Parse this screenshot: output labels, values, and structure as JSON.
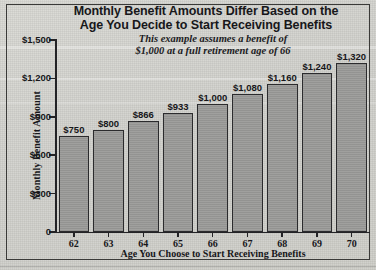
{
  "figure": {
    "title_line1": "Monthly Benefit Amounts Differ Based on the",
    "title_line2": "Age You Decide to Start Receiving Benefits",
    "subtitle_line1": "This example assumes a benefit of",
    "subtitle_line2": "$1,000 at a full retirement age of 66",
    "bar_fill_color": "#9b9b99",
    "bar_outline_color": "#2b2b2d",
    "background_color": "#d4d4cf",
    "text_color": "#17171a"
  },
  "chart_data": {
    "type": "bar",
    "title": "Monthly Benefit Amounts Differ Based on the Age You Decide to Start Receiving Benefits",
    "subtitle": "This example assumes a benefit of $1,000 at a full retirement age of 66",
    "xlabel": "Age You Choose to Start Receiving Benefits",
    "ylabel": "Monthly Benefit Amount",
    "categories": [
      "62",
      "63",
      "64",
      "65",
      "66",
      "67",
      "68",
      "69",
      "70"
    ],
    "values": [
      750,
      800,
      866,
      933,
      1000,
      1080,
      1160,
      1240,
      1320
    ],
    "value_labels": [
      "$750",
      "$800",
      "$866",
      "$933",
      "$1,000",
      "$1,080",
      "$1,160",
      "$1,240",
      "$1,320"
    ],
    "ylim": [
      0,
      1500
    ],
    "ytick_values": [
      0,
      300,
      600,
      900,
      1200,
      1500
    ],
    "ytick_labels": [
      "0",
      "$300",
      "$600",
      "$900",
      "$1,200",
      "$1,500"
    ],
    "grid": false,
    "legend": null
  }
}
